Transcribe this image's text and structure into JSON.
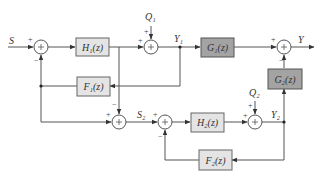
{
  "diagram": {
    "signals": {
      "S": "S",
      "Y": "Y",
      "Y1": "Y₁",
      "Y2": "Y₂",
      "S2": "S₂",
      "Q1": "Q₁",
      "Q2": "Q₂"
    },
    "blocks": {
      "H1": "H₁(z)",
      "F1": "F₁(z)",
      "G1": "G₁(z)",
      "G2": "G₂(z)",
      "H2": "H₂(z)",
      "F2": "F₂(z)"
    },
    "signs": {
      "sum1_S": "+",
      "sum1_fb": "−",
      "sum2_in": "+",
      "sum2_Q1": "+",
      "sum3_in": "+",
      "sum3_G2": "−",
      "sum4_left": "+",
      "sum4_top": "−",
      "sum5_left": "+",
      "sum5_fb": "−",
      "sum6_in": "+",
      "sum6_Q2": "+"
    },
    "colors": {
      "light_block": "#e4e4e4",
      "dark_block": "#a3a3a3"
    }
  }
}
